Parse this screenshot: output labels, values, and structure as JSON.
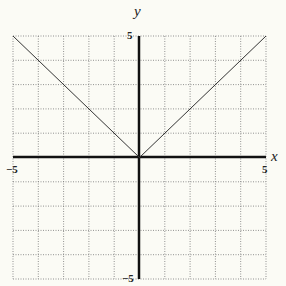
{
  "chart_data": {
    "type": "line",
    "title": "",
    "xlabel": "x",
    "ylabel": "y",
    "xlim": [
      -5,
      5
    ],
    "ylim": [
      -5,
      5
    ],
    "grid": true,
    "grid_step": 1,
    "tick_labels": {
      "x_min": "-5",
      "x_max": "5",
      "y_min": "-5",
      "y_max": "5"
    },
    "series": [
      {
        "name": "y = |x|",
        "x": [
          -5,
          0,
          5
        ],
        "y": [
          5,
          0,
          5
        ]
      }
    ]
  },
  "labels": {
    "x_axis": "x",
    "y_axis": "y",
    "x_min": "−5",
    "x_max": "5",
    "y_min": "−5",
    "y_max": "5"
  }
}
